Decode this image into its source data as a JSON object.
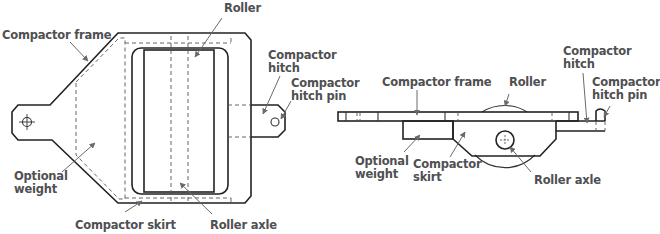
{
  "diagram": {
    "plan_view": {
      "labels": {
        "roller": "Roller",
        "compactor_frame": "Compactor frame",
        "compactor_hitch_line1": "Compactor",
        "compactor_hitch_line2": "hitch",
        "compactor_hitch_pin_line1": "Compactor",
        "compactor_hitch_pin_line2": "hitch pin",
        "optional_weight_line1": "Optional",
        "optional_weight_line2": "weight",
        "compactor_skirt": "Compactor skirt",
        "roller_axle": "Roller axle"
      }
    },
    "side_view": {
      "labels": {
        "compactor_frame": "Compactor frame",
        "roller": "Roller",
        "compactor_hitch_line1": "Compactor",
        "compactor_hitch_line2": "hitch",
        "compactor_hitch_pin_line1": "Compactor",
        "compactor_hitch_pin_line2": "hitch pin",
        "optional_weight_line1": "Optional",
        "optional_weight_line2": "weight",
        "compactor_skirt_line1": "Compactor",
        "compactor_skirt_line2": "skirt",
        "roller_axle": "Roller axle"
      }
    },
    "colors": {
      "line": "#222222",
      "label_text": "#4f5052",
      "leader": "#6a6a6a",
      "background": "#ffffff"
    }
  }
}
